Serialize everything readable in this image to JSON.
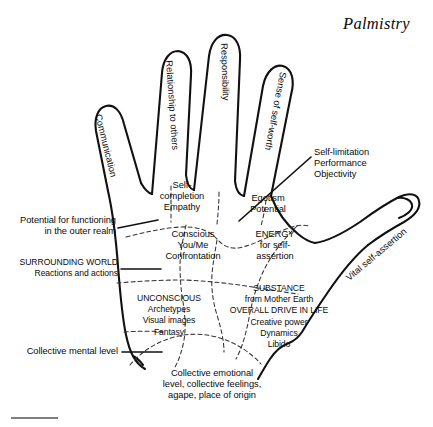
{
  "document": {
    "title": "Palmistry",
    "subject": "palm-diagram-of-psychological-zones"
  },
  "fingers": [
    {
      "id": "little-finger",
      "label": "Communication"
    },
    {
      "id": "ring-finger-left",
      "label": "Relationship to others"
    },
    {
      "id": "middle-finger",
      "label": "Responsibility"
    },
    {
      "id": "index-finger",
      "label": "Sense of self-worth"
    },
    {
      "id": "thumb",
      "label": "Vital self-assertion"
    }
  ],
  "palm_zones": [
    {
      "id": "self-completion",
      "lines": [
        "Self-",
        "completion",
        "Empathy"
      ],
      "text": "Self-\ncompletion\nEmpathy"
    },
    {
      "id": "egotism",
      "lines": [
        "Egotism",
        "Potential"
      ],
      "text": "Egotism\nPotential"
    },
    {
      "id": "conscious",
      "lines": [
        "Conscious",
        "You/Me",
        "Confrontation"
      ],
      "text": "Conscious\nYou/Me\nConfrontation"
    },
    {
      "id": "energy",
      "lines": [
        "ENERGY",
        "for self-",
        "assertion"
      ],
      "text": "ENERGY\nfor self-\nassertion"
    },
    {
      "id": "unconscious",
      "lines": [
        "UNCONSCIOUS",
        "Archetypes",
        "Visual images",
        "Fantasy"
      ],
      "text": "UNCONSCIOUS\nArchetypes\nVisual images\nFantasy"
    },
    {
      "id": "substance",
      "lines": [
        "SUBSTANCE",
        "from Mother Earth",
        "OVERALL DRIVE IN LIFE",
        "Creative power",
        "Dynamics",
        "Libido"
      ],
      "text": "SUBSTANCE\nfrom Mother Earth\nOVERALL DRIVE IN LIFE\nCreative power\nDynamics\nLibido"
    },
    {
      "id": "collective-emotional",
      "lines": [
        "Collective emotional",
        "level, collective feelings,",
        "agape, place of origin"
      ],
      "text": "Collective emotional\nlevel, collective feelings,\nagape, place of origin"
    }
  ],
  "annotations": [
    {
      "id": "self-limitation",
      "side": "right",
      "lines": [
        "Self-limitation",
        "Performance",
        "Objectivity"
      ],
      "text": "Self-limitation\nPerformance\nObjectivity"
    },
    {
      "id": "potential-outer-realm",
      "side": "left",
      "lines": [
        "Potential for functioning",
        "in the outer realm"
      ],
      "text": "Potential for functioning\nin the outer realm"
    },
    {
      "id": "surrounding-world",
      "side": "left",
      "lines": [
        "SURROUNDING WORLD",
        "Reactions and actions"
      ],
      "text": "SURROUNDING WORLD\nReactions and actions"
    },
    {
      "id": "collective-mental-level",
      "side": "left",
      "lines": [
        "Collective mental level"
      ],
      "text": "Collective mental level"
    }
  ],
  "colors": {
    "ink": "#111111",
    "zone_line": "#333333",
    "background": "#ffffff"
  }
}
